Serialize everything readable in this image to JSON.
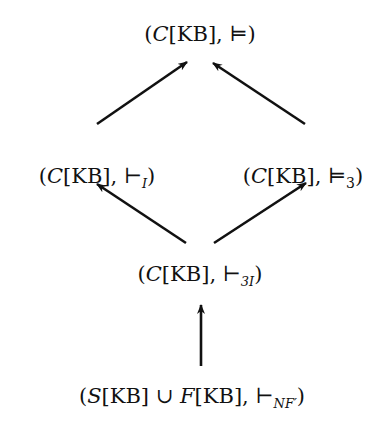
{
  "diagram": {
    "type": "lattice",
    "nodes": [
      {
        "id": "top",
        "set": "C",
        "kb": "[KB]",
        "sep": ", ",
        "rel": "⊨",
        "sub": "",
        "open": "(",
        "close": ")",
        "x": 200,
        "y": 24
      },
      {
        "id": "left",
        "set": "C",
        "kb": "[KB]",
        "sep": ", ",
        "rel": "⊢",
        "sub": "I",
        "open": "(",
        "close": ")",
        "x": 97,
        "y": 166
      },
      {
        "id": "right",
        "set": "C",
        "kb": "[KB]",
        "sep": ", ",
        "rel": "⊨",
        "sub": "3",
        "open": "(",
        "close": ")",
        "x": 303,
        "y": 166
      },
      {
        "id": "middle",
        "set": "C",
        "kb": "[KB]",
        "sep": ", ",
        "rel": "⊢",
        "sub": "3I",
        "open": "(",
        "close": ")",
        "x": 200,
        "y": 264
      },
      {
        "id": "bottom",
        "set": "S",
        "kb": "[KB]",
        "union": " ∪ ",
        "set2": "F",
        "kb2": "[KB]",
        "sep": ",  ",
        "rel": "⊢",
        "sub": "NF′",
        "open": "(",
        "close": ")",
        "x": 192,
        "y": 386
      }
    ],
    "edges": [
      {
        "from": "left",
        "to": "top",
        "x1": 97,
        "y1": 124,
        "x2": 187,
        "y2": 62
      },
      {
        "from": "right",
        "to": "top",
        "x1": 305,
        "y1": 124,
        "x2": 213,
        "y2": 63
      },
      {
        "from": "middle",
        "to": "left",
        "x1": 186,
        "y1": 243,
        "x2": 97,
        "y2": 184
      },
      {
        "from": "middle",
        "to": "right",
        "x1": 214,
        "y1": 243,
        "x2": 306,
        "y2": 183
      },
      {
        "from": "bottom",
        "to": "middle",
        "x1": 201,
        "y1": 366,
        "x2": 201,
        "y2": 305
      }
    ],
    "stroke_color": "#111111"
  }
}
